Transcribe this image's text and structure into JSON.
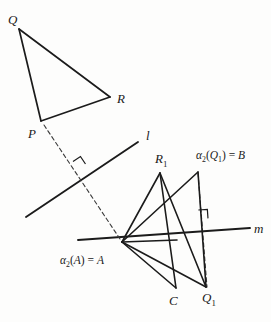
{
  "figure": {
    "stroke_color": "#1b1b1b",
    "background": "#fdfdfc",
    "upper_triangle": {
      "name": "triangle-PQR",
      "vertices": {
        "P": {
          "x": 41,
          "y": 121
        },
        "Q": {
          "x": 19,
          "y": 29
        },
        "R": {
          "x": 110,
          "y": 97
        }
      }
    },
    "line_l": {
      "label": "l",
      "x1": 26,
      "y1": 217,
      "x2": 138,
      "y2": 142,
      "label_x": 146,
      "label_y": 129
    },
    "line_m": {
      "label": "m",
      "x1": 78,
      "y1": 240,
      "x2": 250,
      "y2": 228,
      "label_x": 254,
      "label_y": 222
    },
    "dashed_P_to_A": {
      "x1": 44,
      "y1": 125,
      "x2": 122,
      "y2": 242
    },
    "dashed_B_to_Q1": {
      "x1": 198,
      "y1": 173,
      "x2": 207,
      "y2": 287
    },
    "right_angle_on_l": {
      "x": 78,
      "y": 169,
      "size": 9,
      "rotate": -33.8
    },
    "right_angle_on_m": {
      "x": 199,
      "y": 219,
      "size": 9,
      "rotate": -4
    },
    "lower_points": {
      "A": {
        "x": 122,
        "y": 242
      },
      "R1": {
        "x": 160,
        "y": 173
      },
      "B": {
        "x": 198,
        "y": 172
      },
      "C": {
        "x": 176,
        "y": 288
      },
      "Q1": {
        "x": 206,
        "y": 287
      },
      "M": {
        "x": 177,
        "y": 240
      }
    },
    "lower_segments": [
      {
        "name": "A-R1",
        "x1": 122,
        "y1": 242,
        "x2": 160,
        "y2": 173
      },
      {
        "name": "A-B",
        "x1": 122,
        "y1": 242,
        "x2": 198,
        "y2": 172
      },
      {
        "name": "A-M",
        "x1": 122,
        "y1": 242,
        "x2": 177,
        "y2": 240
      },
      {
        "name": "A-C",
        "x1": 122,
        "y1": 242,
        "x2": 176,
        "y2": 288
      },
      {
        "name": "A-Q1",
        "x1": 122,
        "y1": 242,
        "x2": 206,
        "y2": 287
      },
      {
        "name": "R1-C",
        "x1": 160,
        "y1": 173,
        "x2": 176,
        "y2": 288
      },
      {
        "name": "B-Q1",
        "x1": 198,
        "y1": 172,
        "x2": 206,
        "y2": 287
      },
      {
        "name": "R1-Q1",
        "x1": 160,
        "y1": 173,
        "x2": 206,
        "y2": 287
      }
    ]
  },
  "labels": {
    "Q": {
      "text": "Q",
      "x": 8,
      "y": 13
    },
    "R": {
      "text": "R",
      "x": 117,
      "y": 92
    },
    "P": {
      "text": "P",
      "x": 28,
      "y": 127
    },
    "l": {
      "text": "l",
      "x": 146,
      "y": 129
    },
    "m": {
      "text": "m",
      "x": 254,
      "y": 222
    },
    "R1": {
      "text": "R",
      "sub": "1",
      "x": 155,
      "y": 152
    },
    "C": {
      "text": "C",
      "x": 169,
      "y": 294
    },
    "Q1": {
      "text": "Q",
      "sub": "1",
      "x": 202,
      "y": 291
    },
    "alpha2_Q1_eq_B": {
      "alpha": "α",
      "sub": "2",
      "open": "(",
      "arg": "Q",
      "arg_sub": "1",
      "close": ")",
      "eq": " = ",
      "result": "B",
      "x": 196,
      "y": 150
    },
    "alpha2_A_eq_A": {
      "alpha": "α",
      "sub": "2",
      "open": "(",
      "arg": "A",
      "close": ")",
      "eq": " = ",
      "result": "A",
      "x": 60,
      "y": 255
    }
  }
}
